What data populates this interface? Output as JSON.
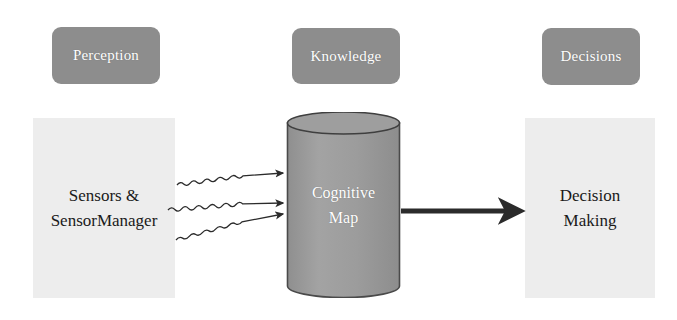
{
  "diagram": {
    "background_color": "#ffffff",
    "chip_color": "#8d8d8d",
    "chip_text_color": "#ffffff",
    "panel_color": "#ededed",
    "panel_text_color": "#1a1a1a",
    "cylinder_color": "#9b9b9b",
    "cylinder_outline_color": "#4a4a4a",
    "arrow_color": "#2b2b2b"
  },
  "chips": [
    {
      "id": "perception",
      "label": "Perception"
    },
    {
      "id": "knowledge",
      "label": "Knowledge"
    },
    {
      "id": "decisions",
      "label": "Decisions"
    }
  ],
  "nodes": {
    "sensors": {
      "line1": "Sensors &",
      "line2": "SensorManager"
    },
    "cognitive_map": {
      "line1": "Cognitive",
      "line2": "Map"
    },
    "decision_making": {
      "line1": "Decision",
      "line2": "Making"
    }
  },
  "connectors": {
    "wavy_arrows": {
      "name": "sensor-data-streams",
      "count": 3,
      "style": "wavy",
      "direction": "left-to-right",
      "from": "sensors",
      "to": "cognitive_map"
    },
    "straight_arrow": {
      "name": "knowledge-to-decision",
      "style": "straight-thick",
      "direction": "left-to-right",
      "from": "cognitive_map",
      "to": "decision_making"
    }
  }
}
